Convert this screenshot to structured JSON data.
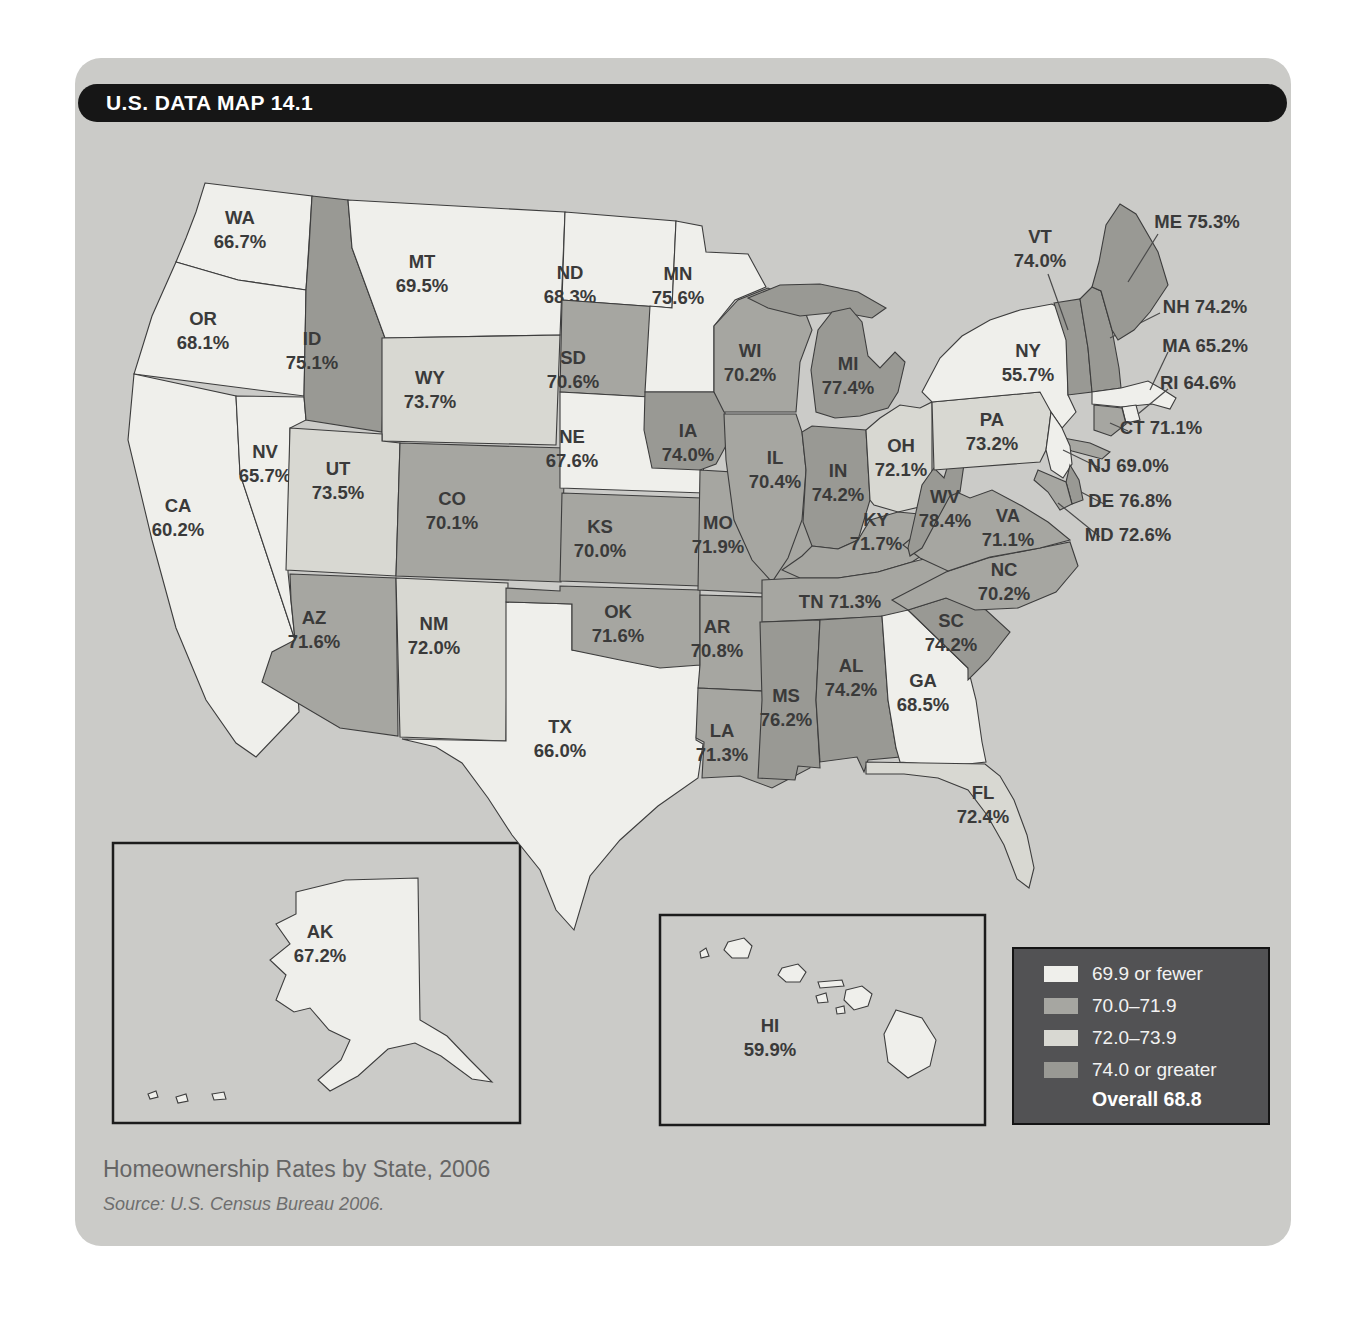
{
  "figure": {
    "kicker": "U.S. DATA MAP 14.1",
    "caption": "Homeownership Rates by State, 2006",
    "source": "Source: U.S. Census Bureau 2006."
  },
  "colors": {
    "category_1": "#efefeb",
    "category_2": "#a6a6a1",
    "category_3": "#d8d8d2",
    "category_4": "#999994",
    "border": "#3d3d3d",
    "card_bg": "#cbcbc8",
    "title_bar_bg": "#161616",
    "legend_bg": "#525254",
    "leader_line": "#4a4a4a"
  },
  "legend": {
    "items": [
      {
        "label": "69.9 or fewer",
        "category": 1
      },
      {
        "label": "70.0–71.9",
        "category": 2
      },
      {
        "label": "72.0–73.9",
        "category": 3
      },
      {
        "label": "74.0 or greater",
        "category": 4
      }
    ],
    "overall": "Overall 68.8"
  },
  "map": {
    "states": [
      {
        "abbr": "WA",
        "value": "66.7%",
        "category": 1
      },
      {
        "abbr": "OR",
        "value": "68.1%",
        "category": 1
      },
      {
        "abbr": "CA",
        "value": "60.2%",
        "category": 1
      },
      {
        "abbr": "NV",
        "value": "65.7%",
        "category": 1
      },
      {
        "abbr": "ID",
        "value": "75.1%",
        "category": 4
      },
      {
        "abbr": "MT",
        "value": "69.5%",
        "category": 1
      },
      {
        "abbr": "WY",
        "value": "73.7%",
        "category": 3
      },
      {
        "abbr": "UT",
        "value": "73.5%",
        "category": 3
      },
      {
        "abbr": "CO",
        "value": "70.1%",
        "category": 2
      },
      {
        "abbr": "AZ",
        "value": "71.6%",
        "category": 2
      },
      {
        "abbr": "NM",
        "value": "72.0%",
        "category": 3
      },
      {
        "abbr": "TX",
        "value": "66.0%",
        "category": 1
      },
      {
        "abbr": "ND",
        "value": "68.3%",
        "category": 1
      },
      {
        "abbr": "SD",
        "value": "70.6%",
        "category": 2
      },
      {
        "abbr": "NE",
        "value": "67.6%",
        "category": 1
      },
      {
        "abbr": "KS",
        "value": "70.0%",
        "category": 2
      },
      {
        "abbr": "OK",
        "value": "71.6%",
        "category": 2
      },
      {
        "abbr": "MN",
        "value": "75.6%",
        "category": 1
      },
      {
        "abbr": "IA",
        "value": "74.0%",
        "category": 4
      },
      {
        "abbr": "MO",
        "value": "71.9%",
        "category": 2
      },
      {
        "abbr": "AR",
        "value": "70.8%",
        "category": 2
      },
      {
        "abbr": "LA",
        "value": "71.3%",
        "category": 2
      },
      {
        "abbr": "WI",
        "value": "70.2%",
        "category": 2
      },
      {
        "abbr": "IL",
        "value": "70.4%",
        "category": 2
      },
      {
        "abbr": "IN",
        "value": "74.2%",
        "category": 4
      },
      {
        "abbr": "MI",
        "value": "77.4%",
        "category": 4
      },
      {
        "abbr": "OH",
        "value": "72.1%",
        "category": 3
      },
      {
        "abbr": "KY",
        "value": "71.7%",
        "category": 2
      },
      {
        "abbr": "TN",
        "value": "71.3%",
        "category": 2
      },
      {
        "abbr": "MS",
        "value": "76.2%",
        "category": 4
      },
      {
        "abbr": "AL",
        "value": "74.2%",
        "category": 4
      },
      {
        "abbr": "GA",
        "value": "68.5%",
        "category": 1
      },
      {
        "abbr": "FL",
        "value": "72.4%",
        "category": 3
      },
      {
        "abbr": "SC",
        "value": "74.2%",
        "category": 4
      },
      {
        "abbr": "NC",
        "value": "70.2%",
        "category": 2
      },
      {
        "abbr": "VA",
        "value": "71.1%",
        "category": 2
      },
      {
        "abbr": "WV",
        "value": "78.4%",
        "category": 4
      },
      {
        "abbr": "PA",
        "value": "73.2%",
        "category": 3
      },
      {
        "abbr": "NY",
        "value": "55.7%",
        "category": 1
      },
      {
        "abbr": "VT",
        "value": "74.0%",
        "category": 4
      },
      {
        "abbr": "NH",
        "value": "74.2%",
        "category": 4
      },
      {
        "abbr": "ME",
        "value": "75.3%",
        "category": 4
      },
      {
        "abbr": "MA",
        "value": "65.2%",
        "category": 1
      },
      {
        "abbr": "RI",
        "value": "64.6%",
        "category": 1
      },
      {
        "abbr": "CT",
        "value": "71.1%",
        "category": 2
      },
      {
        "abbr": "NJ",
        "value": "69.0%",
        "category": 1
      },
      {
        "abbr": "DE",
        "value": "76.8%",
        "category": 4
      },
      {
        "abbr": "MD",
        "value": "72.6%",
        "category": 2
      },
      {
        "abbr": "AK",
        "value": "67.2%",
        "category": 1
      },
      {
        "abbr": "HI",
        "value": "59.9%",
        "category": 1
      }
    ]
  }
}
